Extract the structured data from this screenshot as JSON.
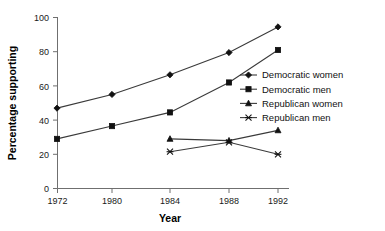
{
  "chart_data": {
    "type": "line",
    "title": "",
    "xlabel": "Year",
    "ylabel": "Percentage supporting",
    "categories": [
      "1972",
      "1980",
      "1984",
      "1988",
      "1992"
    ],
    "x_positions_px": [
      57,
      112,
      170,
      229,
      278
    ],
    "ylim": [
      0,
      100
    ],
    "yticks": [
      "0",
      "20",
      "40",
      "60",
      "80",
      "100"
    ],
    "ytick_values": [
      0,
      20,
      40,
      60,
      80,
      100
    ],
    "grid": false,
    "legend_position": "center-right inside plot",
    "series": [
      {
        "name": "Democratic women",
        "marker": "diamond",
        "values": [
          47,
          55,
          66.5,
          79.5,
          94.5
        ],
        "x": [
          "1972",
          "1980",
          "1984",
          "1988",
          "1992"
        ]
      },
      {
        "name": "Democratic men",
        "marker": "square",
        "values": [
          29,
          36.5,
          44.5,
          62,
          81
        ],
        "x": [
          "1972",
          "1980",
          "1984",
          "1988",
          "1992"
        ]
      },
      {
        "name": "Republican women",
        "marker": "triangle",
        "values": [
          29,
          28,
          34
        ],
        "x": [
          "1984",
          "1988",
          "1992"
        ]
      },
      {
        "name": "Republican men",
        "marker": "cross",
        "values": [
          21.5,
          27,
          20
        ],
        "x": [
          "1984",
          "1988",
          "1992"
        ]
      }
    ],
    "legend": [
      "Democratic women",
      "Democratic men",
      "Republican women",
      "Republican men"
    ],
    "colors": {
      "line": "#3a3a3a",
      "marker": "#111111",
      "axis": "#6f6f6f",
      "text": "#111111",
      "background": "#ffffff"
    }
  }
}
